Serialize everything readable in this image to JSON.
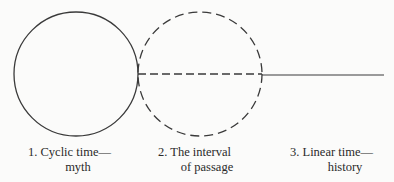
{
  "diagram": {
    "type": "conceptual-time-diagram",
    "stroke_color": "#3a3a3a",
    "shapes": [
      {
        "id": "cyclic-circle",
        "kind": "circle",
        "style": "solid",
        "cx": 76,
        "cy": 74,
        "r": 62
      },
      {
        "id": "interval-circle",
        "kind": "circle",
        "style": "dashed",
        "cx": 200,
        "cy": 74,
        "r": 62
      },
      {
        "id": "interval-line",
        "kind": "line",
        "style": "dashed",
        "x1": 138,
        "y1": 74,
        "x2": 262,
        "y2": 74
      },
      {
        "id": "linear-line",
        "kind": "line",
        "style": "solid",
        "x1": 262,
        "y1": 75,
        "x2": 384,
        "y2": 75
      }
    ],
    "labels": [
      {
        "line1": "1.  Cyclic time—",
        "line2": "myth"
      },
      {
        "line1": "2.  The interval",
        "line2": "of passage"
      },
      {
        "line1": "3.  Linear time—",
        "line2": "history"
      }
    ]
  }
}
